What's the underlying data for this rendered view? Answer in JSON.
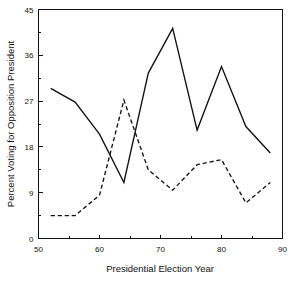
{
  "chart_data": {
    "type": "line",
    "title": "",
    "xlabel": "Presidential Election Year",
    "ylabel": "Percent Voting for Opposition President",
    "xlim": [
      50,
      90
    ],
    "ylim": [
      0,
      45
    ],
    "xticks": [
      50,
      60,
      70,
      80,
      90
    ],
    "xtick_labels": [
      "50",
      "60",
      "70",
      "80",
      "90"
    ],
    "xminorticks": [
      55,
      65,
      75,
      85
    ],
    "yticks": [
      0,
      9,
      18,
      27,
      36,
      45
    ],
    "ytick_labels": [
      "0",
      "9",
      "18",
      "27",
      "36",
      "45"
    ],
    "grid": false,
    "legend": "none",
    "series": [
      {
        "name": "solid-series",
        "style": "solid",
        "x": [
          52,
          56,
          60,
          64,
          68,
          72,
          76,
          80,
          84,
          88
        ],
        "values": [
          29.5,
          26.8,
          20.5,
          11.0,
          32.5,
          41.3,
          21.3,
          33.8,
          22.0,
          16.8
        ]
      },
      {
        "name": "dashed-series",
        "style": "dashed",
        "x": [
          52,
          56,
          60,
          64,
          68,
          72,
          76,
          80,
          84,
          88
        ],
        "values": [
          4.5,
          4.5,
          8.5,
          27.2,
          13.5,
          9.5,
          14.5,
          15.5,
          7.0,
          11.0
        ]
      }
    ]
  },
  "axes": {
    "x_title": "Presidential Election Year",
    "y_title": "Percent Voting for Opposition President"
  }
}
